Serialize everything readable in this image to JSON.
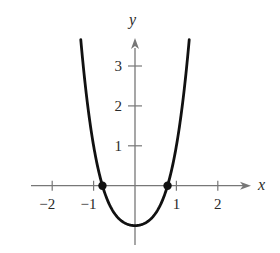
{
  "chart_data": {
    "type": "line",
    "title": "",
    "function": "y = x^4 + x^2 - 1",
    "xlabel": "x",
    "ylabel": "y",
    "xlim": [
      -2.5,
      2.8
    ],
    "ylim": [
      -1.4,
      3.7
    ],
    "grid": false,
    "x_ticks": [
      -2,
      -1,
      1,
      2
    ],
    "x_tick_labels": [
      "−2",
      "−1",
      "1",
      "2"
    ],
    "y_ticks": [
      1,
      2,
      3
    ],
    "y_tick_labels": [
      "1",
      "2",
      "3"
    ],
    "series": [
      {
        "name": "curve",
        "x": [
          -1.3,
          -1.2,
          -1.0,
          -0.786,
          -0.5,
          0,
          0.5,
          0.786,
          1.0,
          1.2,
          1.3
        ],
        "y": [
          3.55,
          2.51,
          1.0,
          0.0,
          -0.69,
          -1.0,
          -0.69,
          0.0,
          1.0,
          2.51,
          3.55
        ]
      }
    ],
    "points": [
      {
        "x": -0.786,
        "y": 0,
        "label": ""
      },
      {
        "x": 0.786,
        "y": 0,
        "label": ""
      }
    ],
    "colors": {
      "curve": "#111111",
      "axes": "#777777",
      "text": "#2a2a2a"
    }
  },
  "axes": {
    "x_label": "x",
    "y_label": "y",
    "x_ticks": [
      "−2",
      "−1",
      "1",
      "2"
    ],
    "y_ticks": [
      "1",
      "2",
      "3"
    ]
  }
}
